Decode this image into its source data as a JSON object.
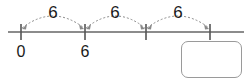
{
  "diagram": {
    "type": "number-line-jumps",
    "title": "",
    "axis": {
      "start_x": 8,
      "end_x": 244,
      "y": 32,
      "color": "#666666"
    },
    "ticks": [
      {
        "x": 21,
        "label": "0"
      },
      {
        "x": 85,
        "label": "6"
      },
      {
        "x": 146,
        "label": ""
      },
      {
        "x": 210,
        "label": ""
      }
    ],
    "jumps": [
      {
        "from_x": 21,
        "to_x": 85,
        "label": "6",
        "label_x": 53,
        "label_y": 18
      },
      {
        "from_x": 85,
        "to_x": 146,
        "label": "6",
        "label_x": 115,
        "label_y": 18
      },
      {
        "from_x": 146,
        "to_x": 210,
        "label": "6",
        "label_x": 178,
        "label_y": 18
      }
    ],
    "colors": {
      "line": "#666666",
      "tick": "#555555",
      "arc": "#8a8a8a",
      "text": "#1a1a1a",
      "box_border": "#9a9a9a",
      "background": "#ffffff"
    }
  },
  "answer_box": {
    "value": "",
    "placeholder": ""
  }
}
